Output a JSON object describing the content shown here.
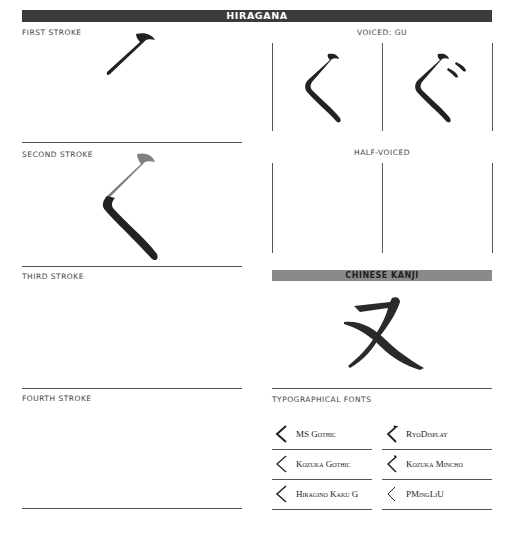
{
  "header": {
    "title": "HIRAGANA"
  },
  "strokes": [
    {
      "label": "FIRST STROKE"
    },
    {
      "label": "SECOND STROKE"
    },
    {
      "label": "THIRD STROKE"
    },
    {
      "label": "FOURTH STROKE"
    }
  ],
  "voiced": {
    "label": "VOICED: GU",
    "base_char": "く",
    "voiced_char": "ぐ"
  },
  "half_voiced": {
    "label": "HALF-VOICED"
  },
  "kanji": {
    "title": "CHINESE KANJI",
    "char": "又"
  },
  "fonts": {
    "label": "TYPOGRAPHICAL FONTS",
    "items": [
      {
        "name": "MS Gothic"
      },
      {
        "name": "RyoDisplay"
      },
      {
        "name": "Kozuka Gothic"
      },
      {
        "name": "Kozuka Mincho"
      },
      {
        "name": "Hiragino Kaku G"
      },
      {
        "name": "PMingLiU"
      }
    ]
  },
  "colors": {
    "header_bg": "#3b3b3b",
    "kanji_bar_bg": "#8a8a8a",
    "stroke_current": "#222222",
    "stroke_previous": "#808080"
  }
}
